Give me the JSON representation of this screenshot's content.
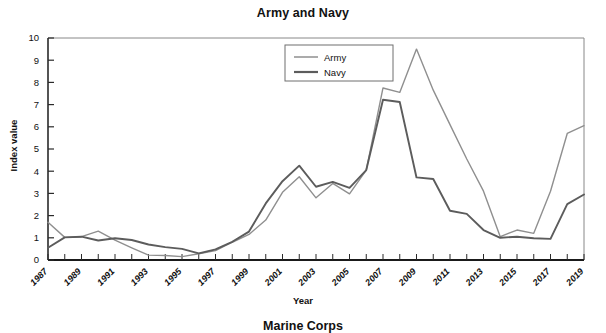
{
  "chart_data": {
    "type": "line",
    "title": "Army and Navy",
    "xlabel": "Year",
    "ylabel": "Index value",
    "xlim": [
      1987,
      2019
    ],
    "ylim": [
      0,
      10
    ],
    "grid": false,
    "legend_position": "top-center",
    "x": [
      1987,
      1988,
      1989,
      1990,
      1991,
      1992,
      1993,
      1994,
      1995,
      1996,
      1997,
      1998,
      1999,
      2000,
      2001,
      2002,
      2003,
      2004,
      2005,
      2006,
      2007,
      2008,
      2009,
      2010,
      2011,
      2012,
      2013,
      2014,
      2015,
      2016,
      2017,
      2018,
      2019
    ],
    "xticks": [
      "1987",
      "1989",
      "1991",
      "1993",
      "1995",
      "1997",
      "1999",
      "2001",
      "2003",
      "2005",
      "2007",
      "2009",
      "2011",
      "2013",
      "2015",
      "2017",
      "2019"
    ],
    "yticks": [
      "0",
      "1",
      "2",
      "3",
      "4",
      "5",
      "6",
      "7",
      "8",
      "9",
      "10"
    ],
    "series": [
      {
        "name": "Army",
        "color": "#8f8f8f",
        "values": [
          1.7,
          1.02,
          1.05,
          1.3,
          0.9,
          0.55,
          0.22,
          0.2,
          0.15,
          0.28,
          0.42,
          0.8,
          1.15,
          1.8,
          3.05,
          3.75,
          2.8,
          3.45,
          2.98,
          4.05,
          7.75,
          7.55,
          9.5,
          7.65,
          6.1,
          4.55,
          3.1,
          1.05,
          1.35,
          1.2,
          3.1,
          5.7,
          6.05
        ]
      },
      {
        "name": "Navy",
        "color": "#5c5c5c",
        "values": [
          0.55,
          1.02,
          1.05,
          0.88,
          0.98,
          0.9,
          0.7,
          0.58,
          0.5,
          0.3,
          0.48,
          0.82,
          1.28,
          2.55,
          3.55,
          4.25,
          3.3,
          3.52,
          3.25,
          4.05,
          7.22,
          7.12,
          3.72,
          3.65,
          2.22,
          2.08,
          1.35,
          1.0,
          1.05,
          0.98,
          0.95,
          2.52,
          2.95
        ]
      }
    ],
    "legend": [
      {
        "label": "Army",
        "color": "#8f8f8f"
      },
      {
        "label": "Navy",
        "color": "#5c5c5c"
      }
    ]
  },
  "next_chart": {
    "title_partial": "Marine Corps"
  }
}
